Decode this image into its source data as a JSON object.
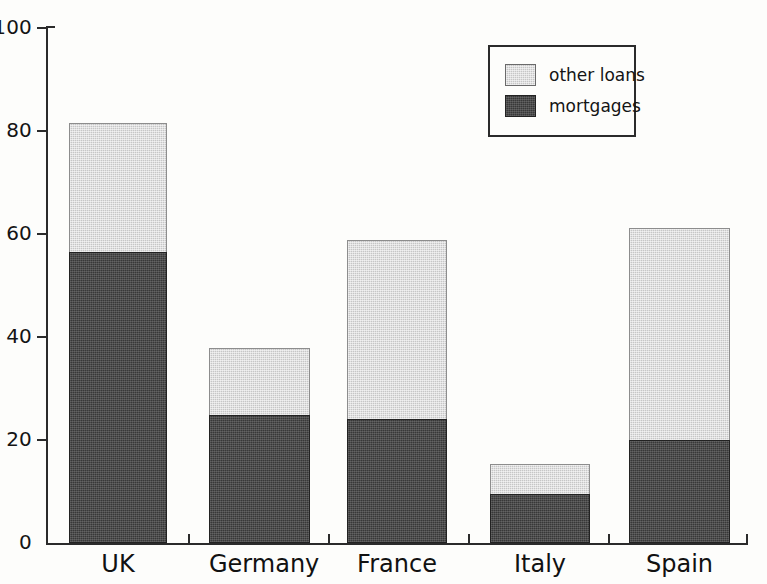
{
  "chart_data": {
    "type": "bar",
    "subtype": "stacked-vertical",
    "title": "",
    "xlabel": "",
    "ylabel": "",
    "categories": [
      "UK",
      "Germany",
      "France",
      "Italy",
      "Spain"
    ],
    "series": [
      {
        "name": "mortgages",
        "color": "#383838",
        "values": [
          56.3,
          24.7,
          23.9,
          9.3,
          19.8
        ]
      },
      {
        "name": "other loans",
        "color": "#c6c6c6",
        "values": [
          25.3,
          13.2,
          34.9,
          6.0,
          41.4
        ]
      }
    ],
    "totals": [
      81.6,
      37.9,
      58.8,
      15.3,
      61.2
    ],
    "ylim": [
      0,
      100
    ],
    "yticks": [
      0,
      20,
      40,
      60,
      80,
      100
    ],
    "ytick_labels": [
      "0",
      "20",
      "40",
      "60",
      "80",
      "100"
    ],
    "grid": false,
    "legend_position": "top-right",
    "legend_entries": [
      "other loans",
      "mortgages"
    ]
  },
  "legend": {
    "entries": [
      {
        "label": "other loans",
        "swatch": "light-gray-swatch"
      },
      {
        "label": "mortgages",
        "swatch": "dark-gray-swatch"
      }
    ]
  },
  "axes": {
    "y_tick_labels": [
      "100",
      "80",
      "60",
      "40",
      "20",
      "0"
    ],
    "x_tick_labels": [
      "UK",
      "Germany",
      "France",
      "Italy",
      "Spain"
    ]
  },
  "colors": {
    "other_loans": "#c6c6c6",
    "mortgages": "#383838",
    "axis": "#2b2b2b",
    "background": "#fdfdfb"
  }
}
